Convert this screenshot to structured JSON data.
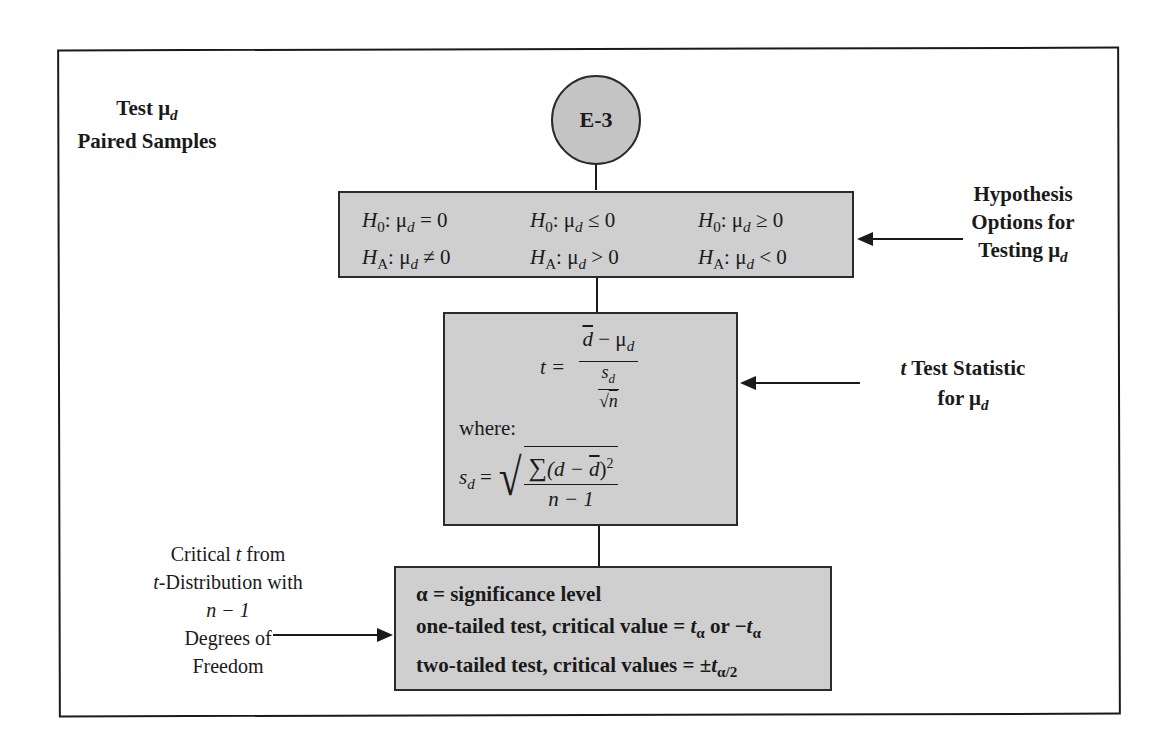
{
  "title": {
    "line1_prefix": "Test ",
    "mu": "μ",
    "sub_d": "d",
    "line2": "Paired Samples"
  },
  "node": {
    "id": "E-3"
  },
  "hypothesis_box": {
    "options": [
      {
        "h0_label": "H",
        "h0_sub": "0",
        "h0_rel": ": μ",
        "h0_mu_sub": "d",
        "h0_expr": " = 0",
        "ha_label": "H",
        "ha_sub": "A",
        "ha_rel": ": μ",
        "ha_mu_sub": "d",
        "ha_expr": " ≠ 0"
      },
      {
        "h0_label": "H",
        "h0_sub": "0",
        "h0_rel": ": μ",
        "h0_mu_sub": "d",
        "h0_expr": " ≤ 0",
        "ha_label": "H",
        "ha_sub": "A",
        "ha_rel": ": μ",
        "ha_mu_sub": "d",
        "ha_expr": " > 0"
      },
      {
        "h0_label": "H",
        "h0_sub": "0",
        "h0_rel": ": μ",
        "h0_mu_sub": "d",
        "h0_expr": " ≥ 0",
        "ha_label": "H",
        "ha_sub": "A",
        "ha_rel": ": μ",
        "ha_mu_sub": "d",
        "ha_expr": " < 0"
      }
    ]
  },
  "hypothesis_label": {
    "line1": "Hypothesis",
    "line2": "Options for",
    "line3_prefix": "Testing ",
    "mu": "μ",
    "sub_d": "d"
  },
  "t_stat_box": {
    "t_lhs": "t =",
    "numerator_dbar": "d",
    "numerator_rest": " − μ",
    "numerator_sub": "d",
    "den_num_s": "s",
    "den_num_sub": "d",
    "den_sqrt": "√",
    "den_n": "n",
    "where": "where:",
    "sd_lhs_s": "s",
    "sd_lhs_sub": "d",
    "sd_eq": " =",
    "sum_symbol": "∑",
    "sum_open": "(d − ",
    "sum_dbar": "d",
    "sum_close": ")",
    "sum_exp": "2",
    "sd_den": "n − 1"
  },
  "t_stat_label": {
    "line1_it": "t",
    "line1_rest": " Test Statistic",
    "line2_prefix": "for ",
    "mu": "μ",
    "sub_d": "d"
  },
  "critical_box": {
    "line1": "α = significance level",
    "line2_prefix": "one-tailed test, critical value = ",
    "t": "t",
    "alpha_sub": "α",
    "or": " or −",
    "line3_prefix": "two-tailed test, critical values = ±",
    "alpha_half_sub": "α/2"
  },
  "critical_label": {
    "line1_prefix": "Critical ",
    "line1_it": "t",
    "line1_suffix": " from",
    "line2_it": "t",
    "line2_rest": "-Distribution with",
    "line3": "n − 1",
    "line4": "Degrees of",
    "line5": "Freedom"
  },
  "colors": {
    "box_fill": "#cfcfcf",
    "circle_fill": "#c4c4c4",
    "line": "#1a1a1a"
  }
}
